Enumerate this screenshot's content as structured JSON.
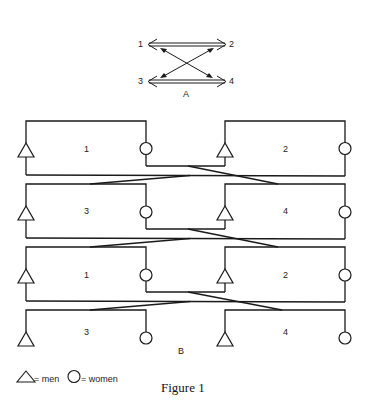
{
  "figure": {
    "caption": "Figure 1",
    "panel_a": {
      "label": "A",
      "nodes": [
        {
          "id": "1",
          "label": "1"
        },
        {
          "id": "2",
          "label": "2"
        },
        {
          "id": "3",
          "label": "3"
        },
        {
          "id": "4",
          "label": "4"
        }
      ],
      "edges": [
        {
          "from": "1",
          "to": "2",
          "type": "double-arrow-bidirectional"
        },
        {
          "from": "3",
          "to": "4",
          "type": "double-arrow-bidirectional"
        },
        {
          "from": "1",
          "to": "4",
          "type": "arrow-bidirectional"
        },
        {
          "from": "2",
          "to": "3",
          "type": "arrow-bidirectional"
        }
      ]
    },
    "panel_b": {
      "label": "B",
      "rows": [
        {
          "left": "1",
          "right": "2"
        },
        {
          "left": "3",
          "right": "4"
        },
        {
          "left": "1",
          "right": "2"
        },
        {
          "left": "3",
          "right": "4"
        }
      ]
    },
    "legend": {
      "men_label": "= men",
      "women_label": "= women"
    }
  }
}
